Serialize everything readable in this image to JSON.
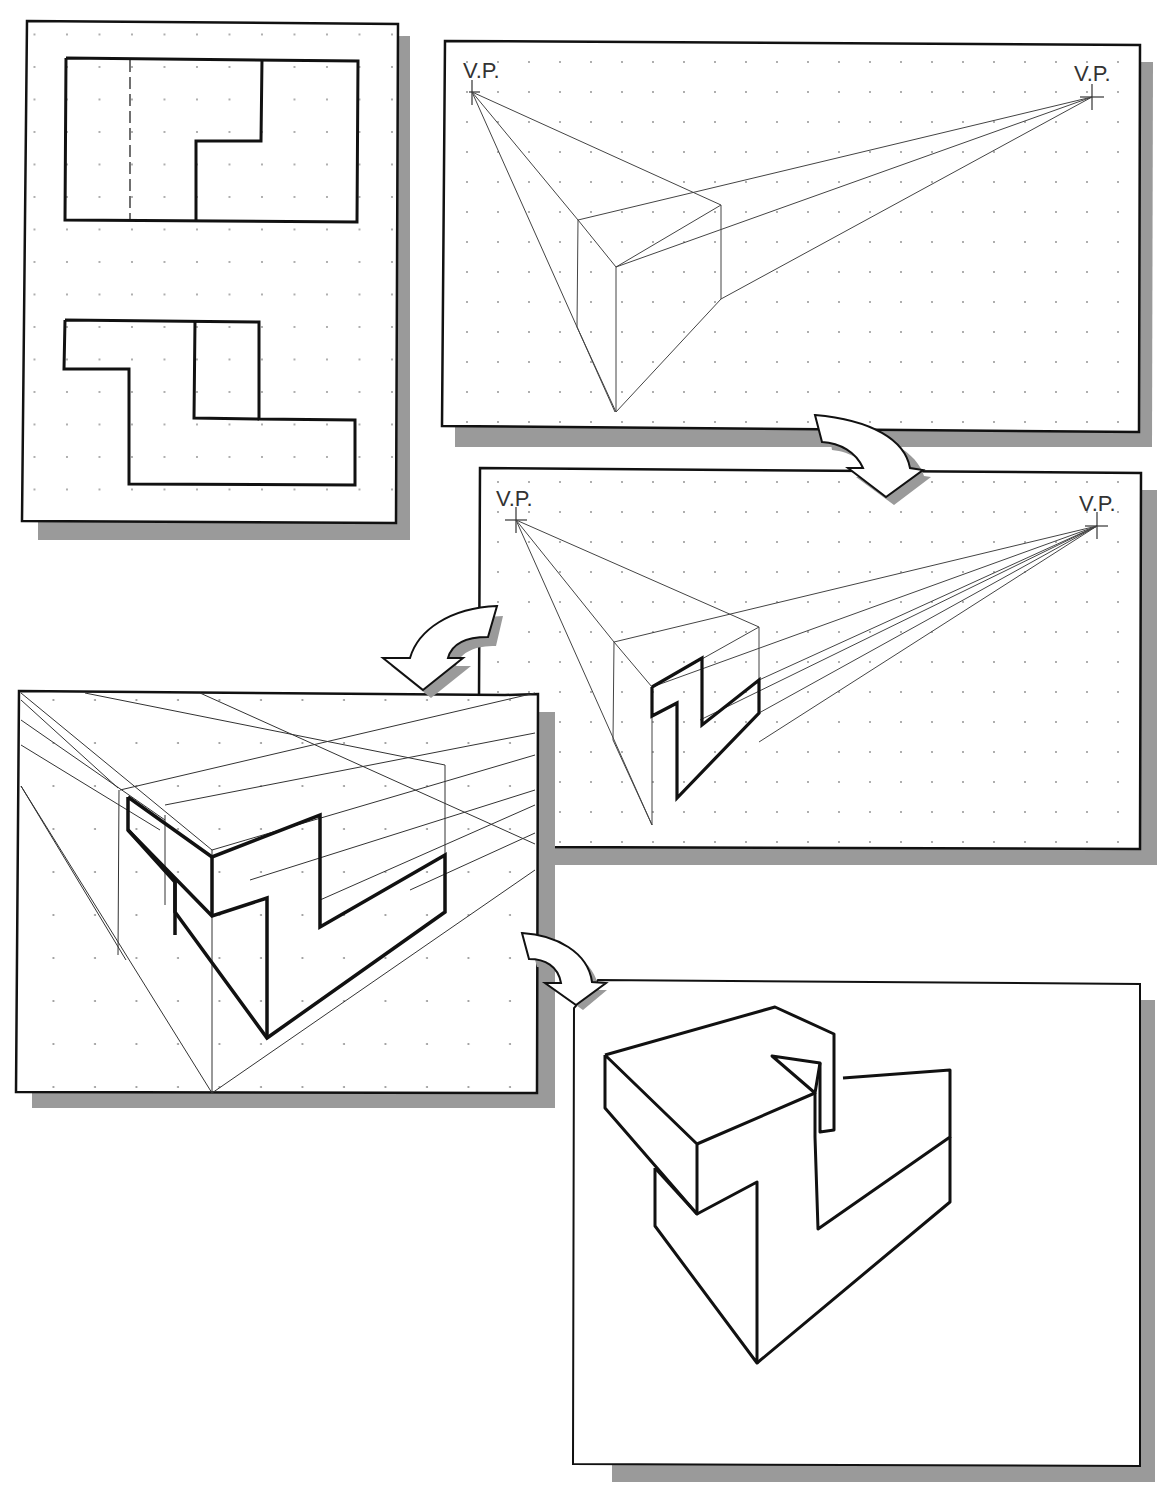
{
  "figure": {
    "colors": {
      "paper": "#ffffff",
      "line": "#111111",
      "construction": "#555555",
      "shadow": "#9a9a9a",
      "grid_dot": "#888888"
    }
  },
  "panels": [
    {
      "id": "orthographic-views",
      "label": "Orthographic views: top view and front view"
    },
    {
      "id": "step-1-box",
      "label": "Bounding box in two-point perspective",
      "vp_left_label": "V.P.",
      "vp_right_label": "V.P."
    },
    {
      "id": "step-2-front-face",
      "label": "Front face profile projected",
      "vp_left_label": "V.P.",
      "vp_right_label": "V.P."
    },
    {
      "id": "step-3-depth",
      "label": "Depth lines projected (zoomed)"
    },
    {
      "id": "step-4-final",
      "label": "Final perspective pictorial"
    }
  ],
  "arrows": [
    {
      "id": "arrow-1",
      "from": "step-1-box",
      "to": "step-2-front-face"
    },
    {
      "id": "arrow-2",
      "from": "step-2-front-face",
      "to": "step-3-depth"
    },
    {
      "id": "arrow-3",
      "from": "step-3-depth",
      "to": "step-4-final"
    }
  ]
}
